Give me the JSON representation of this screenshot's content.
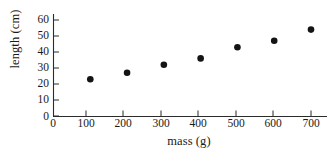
{
  "chart_data": {
    "type": "scatter",
    "title": "",
    "xlabel": "mass (g)",
    "ylabel": "length (cm)",
    "x": [
      100,
      200,
      300,
      400,
      500,
      600,
      700
    ],
    "values": [
      23,
      27,
      32,
      36,
      43,
      47,
      54
    ],
    "series": [
      {
        "name": "length",
        "x": [
          100,
          200,
          300,
          400,
          500,
          600,
          700
        ],
        "values": [
          23,
          27,
          32,
          36,
          43,
          47,
          54
        ]
      }
    ],
    "xlim": [
      0,
      730
    ],
    "ylim": [
      0,
      65
    ],
    "xticks": [
      0,
      100,
      200,
      300,
      400,
      500,
      600,
      700
    ],
    "yticks": [
      0,
      10,
      20,
      30,
      40,
      50,
      60
    ],
    "xtick_labels": [
      "0",
      "100",
      "200",
      "300",
      "400",
      "500",
      "600",
      "700"
    ],
    "ytick_labels": [
      "0",
      "10",
      "20",
      "30",
      "40",
      "50",
      "60"
    ],
    "grid": false,
    "legend": null,
    "marker": "filled-circle",
    "marker_color": "#141414",
    "axis_color": "#2b2b2b",
    "background": "#ffffff"
  }
}
